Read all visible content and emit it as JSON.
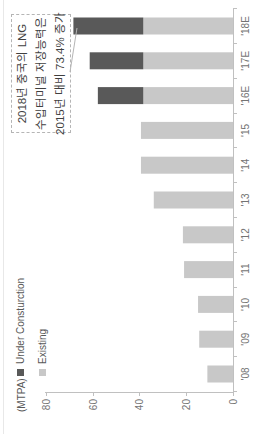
{
  "chart_data": {
    "type": "bar",
    "stacked": true,
    "unit_label": "(MTPA)",
    "categories": [
      "'08",
      "'09",
      "'10",
      "'11",
      "'12",
      "'13",
      "'14",
      "'15",
      "'16E",
      "'17E",
      "'18E"
    ],
    "series": [
      {
        "name": "Existing",
        "color": "#c8c8c8",
        "values": [
          11,
          14.5,
          15,
          21,
          21.5,
          34,
          39.5,
          39.5,
          38.5,
          38.5,
          38.5
        ]
      },
      {
        "name": "Under Consturction",
        "color": "#595959",
        "values": [
          0,
          0,
          0,
          0,
          0,
          0,
          0,
          0,
          19.5,
          23,
          30
        ]
      }
    ],
    "yticks": [
      0,
      20,
      40,
      60,
      80
    ],
    "ylim": [
      0,
      80
    ],
    "grid": false,
    "legend": [
      {
        "label": "Under Consturction",
        "color": "#595959"
      },
      {
        "label": "Existing",
        "color": "#c8c8c8"
      }
    ],
    "annotation": {
      "lines": [
        "2018년 중국의 LNG",
        "수입터미널 저장능력은",
        "2015년 대비 73.4% 증가"
      ]
    }
  },
  "colors": {
    "axis": "#c0c0c0",
    "tick_label": "#737373",
    "annotation_text": "#3f3f3f",
    "callout_line": "#b5b5b5"
  }
}
